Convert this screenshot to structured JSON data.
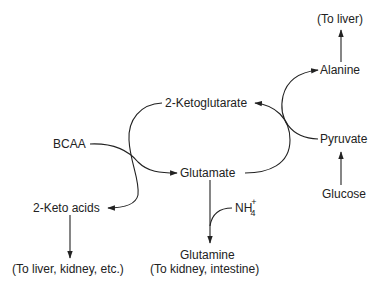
{
  "title_cutoff": "",
  "nodes": {
    "to_liver": "(To liver)",
    "alanine": "Alanine",
    "ketoglutarate": "2-Ketoglutarate",
    "bcaa": "BCAA",
    "pyruvate": "Pyruvate",
    "glutamate": "Glutamate",
    "glucose": "Glucose",
    "keto_acids": "2-Keto acids",
    "ammonium": {
      "base": "NH",
      "subscript": "4",
      "charge": "+"
    },
    "glutamine": "Glutamine",
    "to_liver_kidney": "(To liver, kidney, etc.)",
    "to_kidney_intestine": "(To kidney, intestine)"
  },
  "edges": [
    {
      "from": "BCAA",
      "to": "Glutamate",
      "type": "curved-arrow"
    },
    {
      "from": "2-Ketoglutarate",
      "to": "2-Keto acids",
      "type": "curved-arrow",
      "note": "transamination coupled with BCAA"
    },
    {
      "from": "Glutamate",
      "to": "2-Ketoglutarate",
      "type": "curved-arrow",
      "note": "transamination coupled with Pyruvate"
    },
    {
      "from": "Pyruvate",
      "to": "Alanine",
      "type": "curved-arrow"
    },
    {
      "from": "Alanine",
      "to": "(To liver)",
      "type": "straight-arrow"
    },
    {
      "from": "Glucose",
      "to": "Pyruvate",
      "type": "straight-arrow"
    },
    {
      "from": "Glutamate",
      "to": "Glutamine",
      "type": "straight-arrow",
      "cofactor": "NH4+"
    },
    {
      "from": "2-Keto acids",
      "to": "(To liver, kidney, etc.)",
      "type": "straight-arrow"
    }
  ],
  "colors": {
    "ink": "#222222",
    "background": "#ffffff"
  }
}
